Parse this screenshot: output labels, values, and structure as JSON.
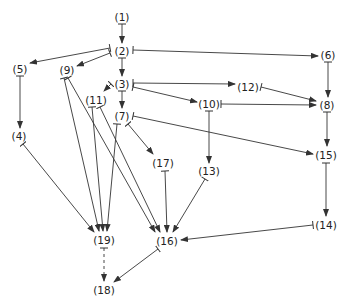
{
  "diagram": {
    "type": "directed-graph",
    "colors": {
      "line": "#333333",
      "text": "#222222",
      "background": "#ffffff"
    },
    "nodes": [
      {
        "id": "1",
        "label": "(1)",
        "x": 122,
        "y": 17
      },
      {
        "id": "2",
        "label": "(2)",
        "x": 122,
        "y": 51
      },
      {
        "id": "3",
        "label": "(3)",
        "x": 122,
        "y": 84
      },
      {
        "id": "5",
        "label": "(5)",
        "x": 20,
        "y": 69
      },
      {
        "id": "9",
        "label": "(9)",
        "x": 67,
        "y": 70
      },
      {
        "id": "11",
        "label": "(11)",
        "x": 96,
        "y": 100
      },
      {
        "id": "7",
        "label": "(7)",
        "x": 122,
        "y": 116
      },
      {
        "id": "6",
        "label": "(6)",
        "x": 328,
        "y": 55
      },
      {
        "id": "12",
        "label": "(12)",
        "x": 248,
        "y": 87
      },
      {
        "id": "10",
        "label": "(10)",
        "x": 209,
        "y": 104
      },
      {
        "id": "8",
        "label": "(8)",
        "x": 327,
        "y": 105
      },
      {
        "id": "15",
        "label": "(15)",
        "x": 326,
        "y": 155
      },
      {
        "id": "17",
        "label": "(17)",
        "x": 163,
        "y": 163
      },
      {
        "id": "13",
        "label": "(13)",
        "x": 209,
        "y": 171
      },
      {
        "id": "4",
        "label": "(4)",
        "x": 19,
        "y": 136
      },
      {
        "id": "14",
        "label": "(14)",
        "x": 326,
        "y": 225
      },
      {
        "id": "19",
        "label": "(19)",
        "x": 104,
        "y": 240
      },
      {
        "id": "16",
        "label": "(16)",
        "x": 167,
        "y": 241
      },
      {
        "id": "18",
        "label": "(18)",
        "x": 104,
        "y": 290
      }
    ],
    "edges": [
      {
        "from": "1",
        "to": "2",
        "x1": 122,
        "y1": 24,
        "x2": 122,
        "y2": 43,
        "style": "solid"
      },
      {
        "from": "2",
        "to": "5",
        "x1": 110,
        "y1": 48,
        "x2": 30,
        "y2": 63,
        "style": "solid"
      },
      {
        "from": "2",
        "to": "9",
        "x1": 110,
        "y1": 53,
        "x2": 77,
        "y2": 66,
        "style": "solid"
      },
      {
        "from": "2",
        "to": "3",
        "x1": 122,
        "y1": 58,
        "x2": 122,
        "y2": 76,
        "style": "solid"
      },
      {
        "from": "2",
        "to": "6",
        "x1": 133,
        "y1": 50,
        "x2": 318,
        "y2": 56,
        "style": "solid"
      },
      {
        "from": "3",
        "to": "11",
        "x1": 111,
        "y1": 84,
        "x2": 104,
        "y2": 91,
        "style": "solid"
      },
      {
        "from": "3",
        "to": "7",
        "x1": 122,
        "y1": 91,
        "x2": 122,
        "y2": 108,
        "style": "solid"
      },
      {
        "from": "3",
        "to": "12",
        "x1": 133,
        "y1": 83,
        "x2": 235,
        "y2": 84,
        "style": "solid"
      },
      {
        "from": "3",
        "to": "10",
        "x1": 133,
        "y1": 87,
        "x2": 197,
        "y2": 102,
        "style": "solid"
      },
      {
        "from": "5",
        "to": "4",
        "x1": 20,
        "y1": 76,
        "x2": 20,
        "y2": 128,
        "style": "solid"
      },
      {
        "from": "6",
        "to": "8",
        "x1": 328,
        "y1": 62,
        "x2": 328,
        "y2": 97,
        "style": "solid"
      },
      {
        "from": "12",
        "to": "8",
        "x1": 261,
        "y1": 87,
        "x2": 316,
        "y2": 101,
        "style": "solid"
      },
      {
        "from": "10",
        "to": "8",
        "x1": 221,
        "y1": 104,
        "x2": 316,
        "y2": 105,
        "style": "solid"
      },
      {
        "from": "8",
        "to": "15",
        "x1": 327,
        "y1": 112,
        "x2": 327,
        "y2": 146,
        "style": "solid"
      },
      {
        "from": "7",
        "to": "15",
        "x1": 133,
        "y1": 116,
        "x2": 313,
        "y2": 154,
        "style": "solid"
      },
      {
        "from": "7",
        "to": "17",
        "x1": 128,
        "y1": 124,
        "x2": 153,
        "y2": 154,
        "style": "solid"
      },
      {
        "from": "10",
        "to": "13",
        "x1": 209,
        "y1": 111,
        "x2": 209,
        "y2": 163,
        "style": "solid"
      },
      {
        "from": "15",
        "to": "14",
        "x1": 326,
        "y1": 163,
        "x2": 326,
        "y2": 216,
        "style": "solid"
      },
      {
        "from": "4",
        "to": "19",
        "x1": 23,
        "y1": 144,
        "x2": 94,
        "y2": 232,
        "style": "solid"
      },
      {
        "from": "9",
        "to": "19",
        "x1": 64,
        "y1": 78,
        "x2": 99,
        "y2": 231,
        "style": "solid"
      },
      {
        "from": "9",
        "to": "16",
        "x1": 68,
        "y1": 78,
        "x2": 155,
        "y2": 232,
        "style": "solid"
      },
      {
        "from": "11",
        "to": "19",
        "x1": 92,
        "y1": 107,
        "x2": 103,
        "y2": 231,
        "style": "solid"
      },
      {
        "from": "11",
        "to": "16",
        "x1": 100,
        "y1": 107,
        "x2": 160,
        "y2": 232,
        "style": "solid"
      },
      {
        "from": "7",
        "to": "19",
        "x1": 117,
        "y1": 124,
        "x2": 107,
        "y2": 231,
        "style": "solid"
      },
      {
        "from": "17",
        "to": "16",
        "x1": 165,
        "y1": 171,
        "x2": 167,
        "y2": 232,
        "style": "solid"
      },
      {
        "from": "13",
        "to": "16",
        "x1": 205,
        "y1": 179,
        "x2": 173,
        "y2": 232,
        "style": "solid"
      },
      {
        "from": "14",
        "to": "16",
        "x1": 313,
        "y1": 225,
        "x2": 181,
        "y2": 240,
        "style": "solid"
      },
      {
        "from": "19",
        "to": "18",
        "x1": 104,
        "y1": 248,
        "x2": 104,
        "y2": 281,
        "style": "dashed"
      },
      {
        "from": "16",
        "to": "18",
        "x1": 158,
        "y1": 249,
        "x2": 114,
        "y2": 282,
        "style": "solid"
      }
    ]
  }
}
